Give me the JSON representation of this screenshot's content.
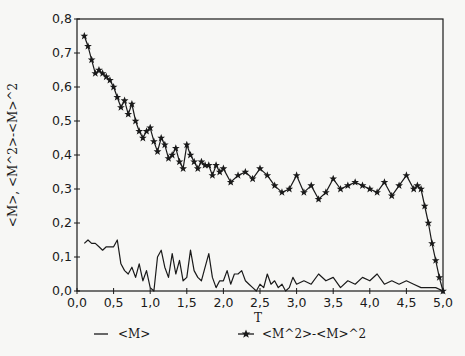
{
  "chart_data": {
    "type": "line",
    "title": "",
    "xlabel": "T",
    "ylabel": "<M>, <M^2>-<M>^2",
    "xlim": [
      0.0,
      5.0
    ],
    "ylim": [
      0.0,
      0.8
    ],
    "xticks": [
      "0,0",
      "0,5",
      "1,0",
      "1,5",
      "2,0",
      "2,5",
      "3,0",
      "3,5",
      "4,0",
      "4,5",
      "5,0"
    ],
    "yticks": [
      "0,0",
      "0,1",
      "0,2",
      "0,3",
      "0,4",
      "0,5",
      "0,6",
      "0,7",
      "0,8"
    ],
    "grid": false,
    "legend_position": "bottom",
    "series": [
      {
        "name": "<M>",
        "marker": "none",
        "x": [
          0.1,
          0.15,
          0.2,
          0.25,
          0.3,
          0.35,
          0.4,
          0.45,
          0.5,
          0.55,
          0.6,
          0.65,
          0.7,
          0.75,
          0.8,
          0.85,
          0.9,
          0.95,
          1.0,
          1.05,
          1.1,
          1.15,
          1.2,
          1.25,
          1.3,
          1.35,
          1.4,
          1.45,
          1.5,
          1.55,
          1.6,
          1.65,
          1.7,
          1.75,
          1.8,
          1.85,
          1.9,
          1.95,
          2.0,
          2.05,
          2.1,
          2.15,
          2.2,
          2.25,
          2.3,
          2.35,
          2.4,
          2.45,
          2.5,
          2.55,
          2.6,
          2.65,
          2.7,
          2.75,
          2.8,
          2.85,
          2.9,
          2.95,
          3.0,
          3.1,
          3.2,
          3.3,
          3.4,
          3.5,
          3.6,
          3.7,
          3.8,
          3.9,
          4.0,
          4.1,
          4.2,
          4.3,
          4.4,
          4.5,
          4.6,
          4.7,
          4.8,
          4.9,
          5.0
        ],
        "values": [
          0.14,
          0.15,
          0.14,
          0.14,
          0.13,
          0.12,
          0.13,
          0.13,
          0.13,
          0.15,
          0.08,
          0.06,
          0.05,
          0.07,
          0.04,
          0.08,
          0.03,
          0.06,
          0.01,
          0.0,
          0.1,
          0.12,
          0.07,
          0.04,
          0.11,
          0.05,
          0.09,
          0.03,
          0.04,
          0.12,
          0.06,
          0.04,
          0.03,
          0.07,
          0.11,
          0.04,
          0.01,
          0.03,
          0.03,
          0.06,
          0.02,
          0.05,
          0.05,
          0.06,
          0.03,
          0.02,
          0.01,
          0.0,
          0.02,
          0.01,
          0.05,
          0.02,
          0.03,
          0.01,
          0.02,
          0.0,
          0.01,
          0.04,
          0.02,
          0.03,
          0.02,
          0.05,
          0.03,
          0.04,
          0.01,
          0.03,
          0.02,
          0.04,
          0.03,
          0.05,
          0.02,
          0.03,
          0.02,
          0.03,
          0.02,
          0.01,
          0.01,
          0.01,
          0.0
        ]
      },
      {
        "name": "<M^2>-<M>^2",
        "marker": "star",
        "x": [
          0.1,
          0.15,
          0.2,
          0.25,
          0.3,
          0.35,
          0.4,
          0.45,
          0.5,
          0.55,
          0.6,
          0.65,
          0.7,
          0.75,
          0.8,
          0.85,
          0.9,
          0.95,
          1.0,
          1.05,
          1.1,
          1.15,
          1.2,
          1.25,
          1.3,
          1.35,
          1.4,
          1.45,
          1.5,
          1.55,
          1.6,
          1.65,
          1.7,
          1.75,
          1.8,
          1.85,
          1.9,
          1.95,
          2.0,
          2.1,
          2.2,
          2.3,
          2.4,
          2.5,
          2.6,
          2.7,
          2.8,
          2.9,
          3.0,
          3.1,
          3.2,
          3.3,
          3.4,
          3.5,
          3.6,
          3.7,
          3.8,
          3.9,
          4.0,
          4.1,
          4.2,
          4.3,
          4.4,
          4.5,
          4.6,
          4.65,
          4.7,
          4.75,
          4.8,
          4.85,
          4.9,
          4.95,
          5.0
        ],
        "values": [
          0.75,
          0.72,
          0.68,
          0.64,
          0.65,
          0.64,
          0.63,
          0.62,
          0.6,
          0.57,
          0.54,
          0.56,
          0.52,
          0.55,
          0.5,
          0.47,
          0.45,
          0.47,
          0.48,
          0.44,
          0.41,
          0.45,
          0.43,
          0.39,
          0.4,
          0.42,
          0.38,
          0.36,
          0.43,
          0.4,
          0.38,
          0.36,
          0.38,
          0.37,
          0.37,
          0.34,
          0.37,
          0.35,
          0.36,
          0.32,
          0.34,
          0.35,
          0.33,
          0.36,
          0.34,
          0.31,
          0.29,
          0.3,
          0.34,
          0.29,
          0.31,
          0.27,
          0.29,
          0.33,
          0.3,
          0.31,
          0.32,
          0.31,
          0.3,
          0.29,
          0.32,
          0.28,
          0.31,
          0.34,
          0.3,
          0.31,
          0.3,
          0.25,
          0.2,
          0.14,
          0.09,
          0.04,
          0.0
        ]
      }
    ]
  },
  "legend": {
    "items": [
      {
        "label": "<M>",
        "symbol": "line"
      },
      {
        "label": "<M^2>-<M>^2",
        "symbol": "star"
      }
    ]
  },
  "colors": {
    "ink": "#1a1a1a",
    "paper": "#f7f7f5"
  }
}
